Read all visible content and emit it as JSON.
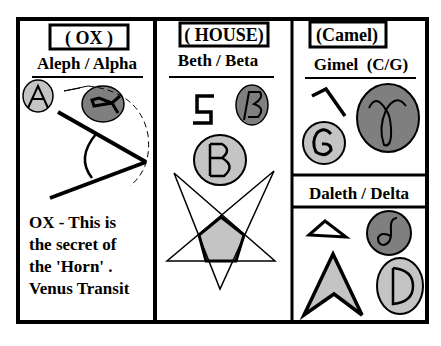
{
  "panels": [
    {
      "id": "aleph",
      "meaning": "( OX )",
      "title": "Aleph / Alpha",
      "glyphs": {
        "latin": "A",
        "greek": "α"
      },
      "caption": [
        "OX - This is",
        "the secret of",
        "the 'Horn' .",
        "Venus Transit"
      ]
    },
    {
      "id": "beth",
      "meaning": "( HOUSE)",
      "title": "Beth / Beta",
      "glyphs": {
        "latin": "B",
        "greek": "β"
      }
    },
    {
      "id": "gimel",
      "meaning": "(Camel)",
      "title": "Gimel  (C/G)",
      "glyphs": {
        "latin": "G",
        "greek": "γ"
      }
    },
    {
      "id": "daleth",
      "title": "Daleth / Delta",
      "glyphs": {
        "latin": "D",
        "greek": "δ"
      }
    }
  ],
  "colors": {
    "light_gray": "#c4c4c4",
    "dark_gray": "#7f7f7f",
    "line": "#000000",
    "background": "#ffffff"
  }
}
